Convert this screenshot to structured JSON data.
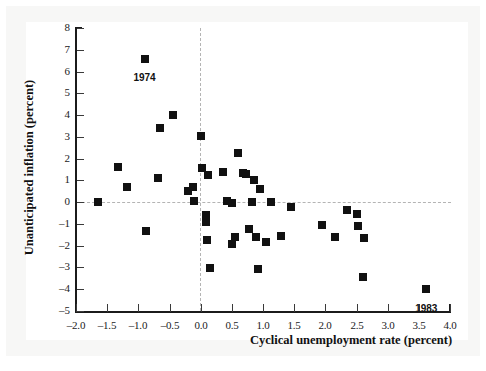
{
  "chart_data": {
    "type": "scatter",
    "title": "",
    "xlabel": "Cyclical unemployment rate (percent)",
    "ylabel": "Unanticipated inflation (percent)",
    "xlim": [
      -2.0,
      4.0
    ],
    "ylim": [
      -5,
      8
    ],
    "xticks": [
      "-2.0",
      "-1.5",
      "-1.0",
      "-0.5",
      "0.0",
      "0.5",
      "1.0",
      "1.5",
      "2.0",
      "2.5",
      "3.0",
      "3.5",
      "4.0"
    ],
    "xtick_values": [
      -2.0,
      -1.5,
      -1.0,
      -0.5,
      0.0,
      0.5,
      1.0,
      1.5,
      2.0,
      2.5,
      3.0,
      3.5,
      4.0
    ],
    "yticks": [
      "8",
      "7",
      "6",
      "5",
      "4",
      "3",
      "2",
      "1",
      "0",
      "-1",
      "-2",
      "-3",
      "-4",
      "-5"
    ],
    "ytick_values": [
      8,
      7,
      6,
      5,
      4,
      3,
      2,
      1,
      0,
      -1,
      -2,
      -3,
      -4,
      -5
    ],
    "grid": false,
    "reference_lines": [
      {
        "axis": "horizontal",
        "value": 0,
        "style": "dashed",
        "color": "#b4b4b4"
      },
      {
        "axis": "vertical",
        "value": 0,
        "style": "dashed",
        "color": "#b4b4b4"
      }
    ],
    "legend": null,
    "marker": {
      "shape": "square",
      "color": "#111111",
      "size_px": 8
    },
    "points": [
      {
        "x": -1.65,
        "y": 0.0
      },
      {
        "x": -1.32,
        "y": 1.6
      },
      {
        "x": -1.18,
        "y": 0.7
      },
      {
        "x": -0.9,
        "y": 6.6,
        "label": "1974"
      },
      {
        "x": -0.88,
        "y": -1.3
      },
      {
        "x": -0.68,
        "y": 1.1
      },
      {
        "x": -0.65,
        "y": 3.4
      },
      {
        "x": -0.45,
        "y": 4.0
      },
      {
        "x": -0.2,
        "y": 0.5
      },
      {
        "x": -0.12,
        "y": 0.7
      },
      {
        "x": -0.1,
        "y": 0.05
      },
      {
        "x": 0.0,
        "y": 3.05
      },
      {
        "x": 0.02,
        "y": 1.55
      },
      {
        "x": 0.08,
        "y": -0.6
      },
      {
        "x": 0.12,
        "y": 1.25
      },
      {
        "x": 0.1,
        "y": -1.75
      },
      {
        "x": 0.08,
        "y": -0.9
      },
      {
        "x": 0.15,
        "y": -3.0
      },
      {
        "x": 0.35,
        "y": 1.4
      },
      {
        "x": 0.42,
        "y": 0.05
      },
      {
        "x": 0.5,
        "y": -0.05
      },
      {
        "x": 0.5,
        "y": -1.9
      },
      {
        "x": 0.55,
        "y": -1.6
      },
      {
        "x": 0.6,
        "y": 2.25
      },
      {
        "x": 0.68,
        "y": 1.35
      },
      {
        "x": 0.72,
        "y": 1.3
      },
      {
        "x": 0.78,
        "y": -1.25
      },
      {
        "x": 0.82,
        "y": 0.0
      },
      {
        "x": 0.85,
        "y": 1.0
      },
      {
        "x": 0.88,
        "y": -1.6
      },
      {
        "x": 0.95,
        "y": 0.6
      },
      {
        "x": 0.92,
        "y": -3.05
      },
      {
        "x": 1.05,
        "y": -1.85
      },
      {
        "x": 1.12,
        "y": 0.0
      },
      {
        "x": 1.28,
        "y": -1.55
      },
      {
        "x": 1.45,
        "y": -0.2
      },
      {
        "x": 1.95,
        "y": -1.05
      },
      {
        "x": 2.15,
        "y": -1.6
      },
      {
        "x": 2.35,
        "y": -0.35
      },
      {
        "x": 2.5,
        "y": -0.55
      },
      {
        "x": 2.52,
        "y": -1.1
      },
      {
        "x": 2.62,
        "y": -1.65
      },
      {
        "x": 2.6,
        "y": -3.45
      },
      {
        "x": 3.62,
        "y": -4.0,
        "label": "1983"
      }
    ],
    "annotations": [
      {
        "text": "1974",
        "x": -0.9,
        "y": 6.6,
        "dx": 0,
        "dy": 14,
        "anchor": "middle"
      },
      {
        "text": "1983",
        "x": 3.62,
        "y": -4.0,
        "dx": 0,
        "dy": 14,
        "anchor": "middle"
      }
    ]
  }
}
